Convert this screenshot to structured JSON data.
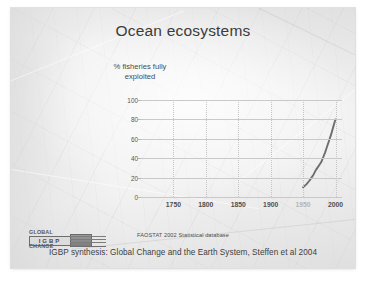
{
  "slide": {
    "title": "Ocean ecosystems",
    "axis_caption_line1": "% fisheries fully",
    "axis_caption_line2": "exploited",
    "source_note": "FAOSTAT 2002 Statistical database",
    "caption": "IGBP synthesis: Global Change and the Earth System, Steffen et al 2004"
  },
  "logo": {
    "word_top": "GLOBAL",
    "word_mid": "IGBP",
    "word_bottom": "CHANGE"
  },
  "colors": {
    "slide_background": "#f2f2f2",
    "title_text": "#3b3b3b",
    "gridline": "#c9c9c9",
    "curve": "#6e6e6e",
    "tick_text": "#4f4f4f"
  },
  "chart_data": {
    "type": "line",
    "title": "",
    "xlabel": "",
    "ylabel": "% fisheries fully exploited",
    "xlim": [
      1700,
      2010
    ],
    "ylim": [
      0,
      100
    ],
    "grid": true,
    "legend": "none",
    "yticks": [
      0,
      20,
      40,
      60,
      80,
      100
    ],
    "xticks": [
      1750,
      1800,
      1850,
      1900,
      1950,
      2000
    ],
    "xticklabels": [
      "1750",
      "1800",
      "1850",
      "1900",
      "1950",
      "2000"
    ],
    "yticklabels": [
      "0",
      "20",
      "40",
      "60",
      "80",
      "100"
    ],
    "series": [
      {
        "name": "% fisheries fully exploited",
        "color": "#6e6e6e",
        "x": [
          1950,
          1955,
          1960,
          1963,
          1966,
          1969,
          1972,
          1975,
          1978,
          1981,
          1984,
          1987,
          1990,
          1993,
          1996,
          1999,
          2000
        ],
        "y": [
          10,
          13,
          17,
          20,
          23,
          27,
          30,
          33,
          36,
          41,
          46,
          52,
          58,
          64,
          71,
          78,
          80
        ]
      }
    ],
    "annotations": [
      "FAOSTAT 2002 Statistical database"
    ]
  }
}
